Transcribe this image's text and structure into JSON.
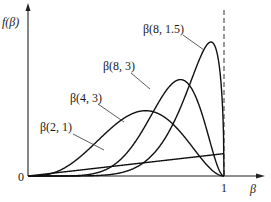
{
  "chart_data": {
    "type": "line",
    "title": "",
    "xlabel": "β",
    "ylabel": "f(β)",
    "x_ticks": [
      "0",
      "1"
    ],
    "xlim": [
      0,
      1.2
    ],
    "grid": false,
    "legend": "inline labels with leader lines",
    "reference_line": {
      "x": 1,
      "style": "dashed vertical"
    },
    "series": [
      {
        "name": "β(2, 1)",
        "alpha": 2,
        "beta": 1,
        "description": "straight line rising from 0 to x=1"
      },
      {
        "name": "β(4, 3)",
        "alpha": 4,
        "beta": 3,
        "description": "broad hump, peak near x=0.6"
      },
      {
        "name": "β(8, 3)",
        "alpha": 8,
        "beta": 3,
        "description": "peak near x=0.78"
      },
      {
        "name": "β(8, 1.5)",
        "alpha": 8,
        "beta": 1.5,
        "description": "tallest, sharp peak near x=0.93"
      }
    ]
  },
  "labels": {
    "y_axis": "f(β)",
    "x_axis": "β",
    "origin": "0",
    "one": "1",
    "s1": "β(2, 1)",
    "s2": "β(4, 3)",
    "s3": "β(8, 3)",
    "s4": "β(8, 1.5)"
  }
}
